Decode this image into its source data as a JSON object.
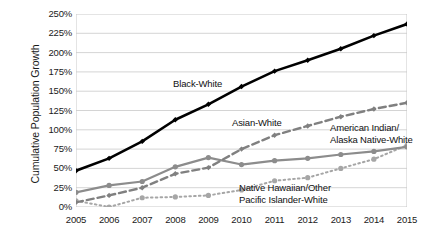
{
  "chart_data": {
    "type": "line",
    "title": "",
    "xlabel": "",
    "ylabel": "Cumulative Population Growth",
    "categories": [
      "2005",
      "2006",
      "2007",
      "2008",
      "2009",
      "2010",
      "2011",
      "2012",
      "2013",
      "2014",
      "2015"
    ],
    "x": [
      2005,
      2006,
      2007,
      2008,
      2009,
      2010,
      2011,
      2012,
      2013,
      2014,
      2015
    ],
    "ylim": [
      0,
      250
    ],
    "ytick_values": [
      0,
      25,
      50,
      75,
      100,
      125,
      150,
      175,
      200,
      225,
      250
    ],
    "ytick_labels": [
      "0%",
      "25%",
      "50%",
      "75%",
      "100%",
      "125%",
      "150%",
      "175%",
      "200%",
      "225%",
      "250%"
    ],
    "grid": "horizontal",
    "legend": "inline-annotations",
    "series": [
      {
        "name": "Black-White",
        "style": "solid",
        "color": "#000000",
        "width": 2.6,
        "marker": "diamond",
        "values": [
          47,
          63,
          85,
          113,
          133,
          156,
          176,
          190,
          205,
          222,
          237
        ]
      },
      {
        "name": "Asian-White",
        "style": "dashed",
        "color": "#808080",
        "width": 2.4,
        "marker": "diamond",
        "values": [
          6,
          15,
          25,
          43,
          51,
          75,
          93,
          105,
          117,
          127,
          135
        ]
      },
      {
        "name": "American Indian/\nAlaska Native-White",
        "style": "solid",
        "color": "#8c8c8c",
        "width": 2.2,
        "marker": "circle",
        "values": [
          19,
          28,
          33,
          52,
          64,
          55,
          60,
          63,
          68,
          72,
          78
        ]
      },
      {
        "name": "Native Hawaiian/Other\nPacific Islander-White",
        "style": "dotted",
        "color": "#a6a6a6",
        "width": 2.0,
        "marker": "circle",
        "values": [
          8,
          0,
          12,
          13,
          15,
          22,
          34,
          38,
          50,
          62,
          80
        ]
      }
    ],
    "annotations": [
      {
        "text": "Black-White",
        "series": "Black-White"
      },
      {
        "text": "Asian-White",
        "series": "Asian-White"
      },
      {
        "text_line1": "American Indian/",
        "text_line2": "Alaska Native-White",
        "series": "American Indian/Alaska Native-White"
      },
      {
        "text_line1": "Native Hawaiian/Other",
        "text_line2": "Pacific Islander-White",
        "series": "Native Hawaiian/Other Pacific Islander-White"
      }
    ]
  },
  "axis": {
    "y_title": "Cumulative Population Growth"
  },
  "labels": {
    "black_white": "Black-White",
    "asian_white": "Asian-White",
    "aian_line1": "American Indian/",
    "aian_line2": "Alaska Native-White",
    "nhpi_line1": "Native Hawaiian/Other",
    "nhpi_line2": "Pacific Islander-White"
  },
  "colors": {
    "black_series": "#000000",
    "asian_series": "#808080",
    "aian_series": "#8c8c8c",
    "nhpi_series": "#a6a6a6",
    "grid": "#c9c9c9",
    "text": "#1a1a1a",
    "background": "#ffffff"
  }
}
